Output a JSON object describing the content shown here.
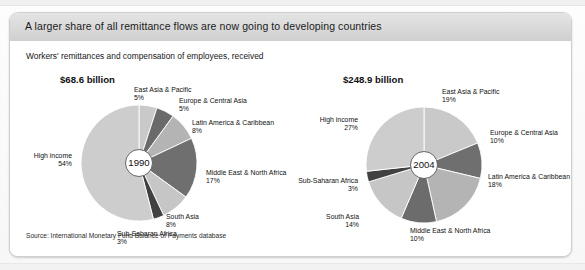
{
  "figure": {
    "title": "A larger share of all remittance flows are now going to developing countries",
    "subtitle": "Workers' remittances and compensation of employees, received",
    "source": "Source: International Monetary Fund Balance of Payments database"
  },
  "chart_data": {
    "type": "pie",
    "title": "A larger share of all remittance flows are now going to developing countries",
    "subtitle": "Workers' remittances and compensation of employees, received",
    "source": "Source: International Monetary Fund Balance of Payments database",
    "unit": "percent of total remittances received",
    "legend": "none (direct slice labels)",
    "charts": [
      {
        "name": "1990",
        "center_label": "1990",
        "total_label": "$68.6 billion",
        "total_value": 68.6,
        "total_unit": "billion US$",
        "categories": [
          "East Asia & Pacific",
          "Europe & Central Asia",
          "Latin America & Caribbean",
          "Middle East & North Africa",
          "South Asia",
          "Sub-Saharan Africa",
          "High income"
        ],
        "values": [
          5,
          5,
          8,
          17,
          8,
          3,
          54
        ],
        "value_labels": [
          "5%",
          "5%",
          "8%",
          "17%",
          "8%",
          "3%",
          "54%"
        ],
        "colors": [
          "#c9c9c9",
          "#6a6a6a",
          "#b4b4b4",
          "#6f6f6f",
          "#c6c6c6",
          "#414141",
          "#cdcdcd"
        ]
      },
      {
        "name": "2004",
        "center_label": "2004",
        "total_label": "$248.9 billion",
        "total_value": 248.9,
        "total_unit": "billion US$",
        "categories": [
          "East Asia & Pacific",
          "Europe & Central Asia",
          "Latin America & Caribbean",
          "Middle East & North Africa",
          "South Asia",
          "Sub-Saharan Africa",
          "High income"
        ],
        "values": [
          19,
          10,
          18,
          10,
          14,
          3,
          27
        ],
        "value_labels": [
          "19%",
          "10%",
          "18%",
          "10%",
          "14%",
          "3%",
          "27%"
        ],
        "colors": [
          "#c9c9c9",
          "#6f6f6f",
          "#b4b4b4",
          "#6c6c6c",
          "#c6c6c6",
          "#414141",
          "#cdcdcd"
        ]
      }
    ]
  }
}
